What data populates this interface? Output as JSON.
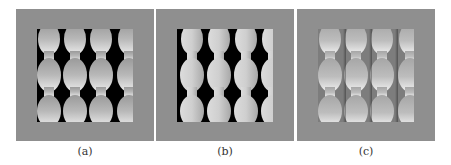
{
  "figure": {
    "panels": [
      {
        "id": "a",
        "caption": "(a)",
        "style": "binary-gradient",
        "frame_color": "#8f8f8f",
        "background_color": "#000000"
      },
      {
        "id": "b",
        "caption": "(b)",
        "style": "binary-uniform",
        "frame_color": "#8f8f8f",
        "background_color": "#000000"
      },
      {
        "id": "c",
        "caption": "(c)",
        "style": "shaded-gray",
        "frame_color": "#8f8f8f",
        "background_color": "#7d7d7d"
      }
    ],
    "pattern": {
      "columns": 4,
      "rows": 3,
      "shape": "ellipse-chain"
    }
  }
}
